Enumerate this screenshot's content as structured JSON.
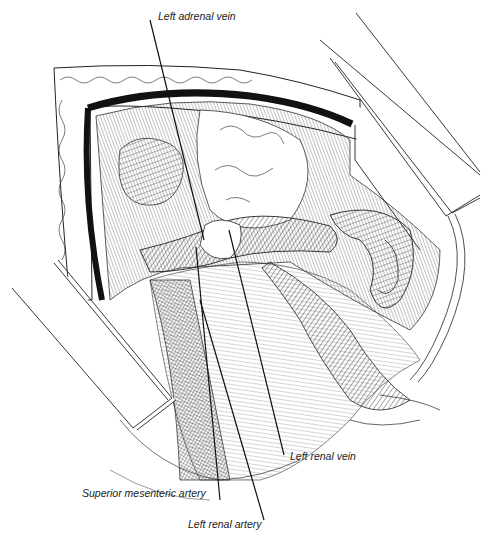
{
  "figure": {
    "type": "surgical anatomical line illustration",
    "labels": [
      {
        "id": "left-adrenal-vein",
        "text": "Left adrenal vein",
        "x": 158,
        "y": 15,
        "line": [
          150,
          20,
          204,
          240
        ]
      },
      {
        "id": "left-renal-vein",
        "text": "Left renal vein",
        "x": 290,
        "y": 454,
        "line": [
          284,
          455,
          229,
          230
        ]
      },
      {
        "id": "superior-mesenteric-artery",
        "text": "Superior mesenteric artery",
        "x": 82,
        "y": 489,
        "line": [
          220,
          500,
          196,
          247
        ]
      },
      {
        "id": "left-renal-artery",
        "text": "Left renal artery",
        "x": 188,
        "y": 521,
        "line": [
          264,
          520,
          200,
          300
        ]
      }
    ],
    "colors": {
      "ink": "#111111",
      "paper": "#ffffff",
      "label_text": "#222222"
    }
  }
}
